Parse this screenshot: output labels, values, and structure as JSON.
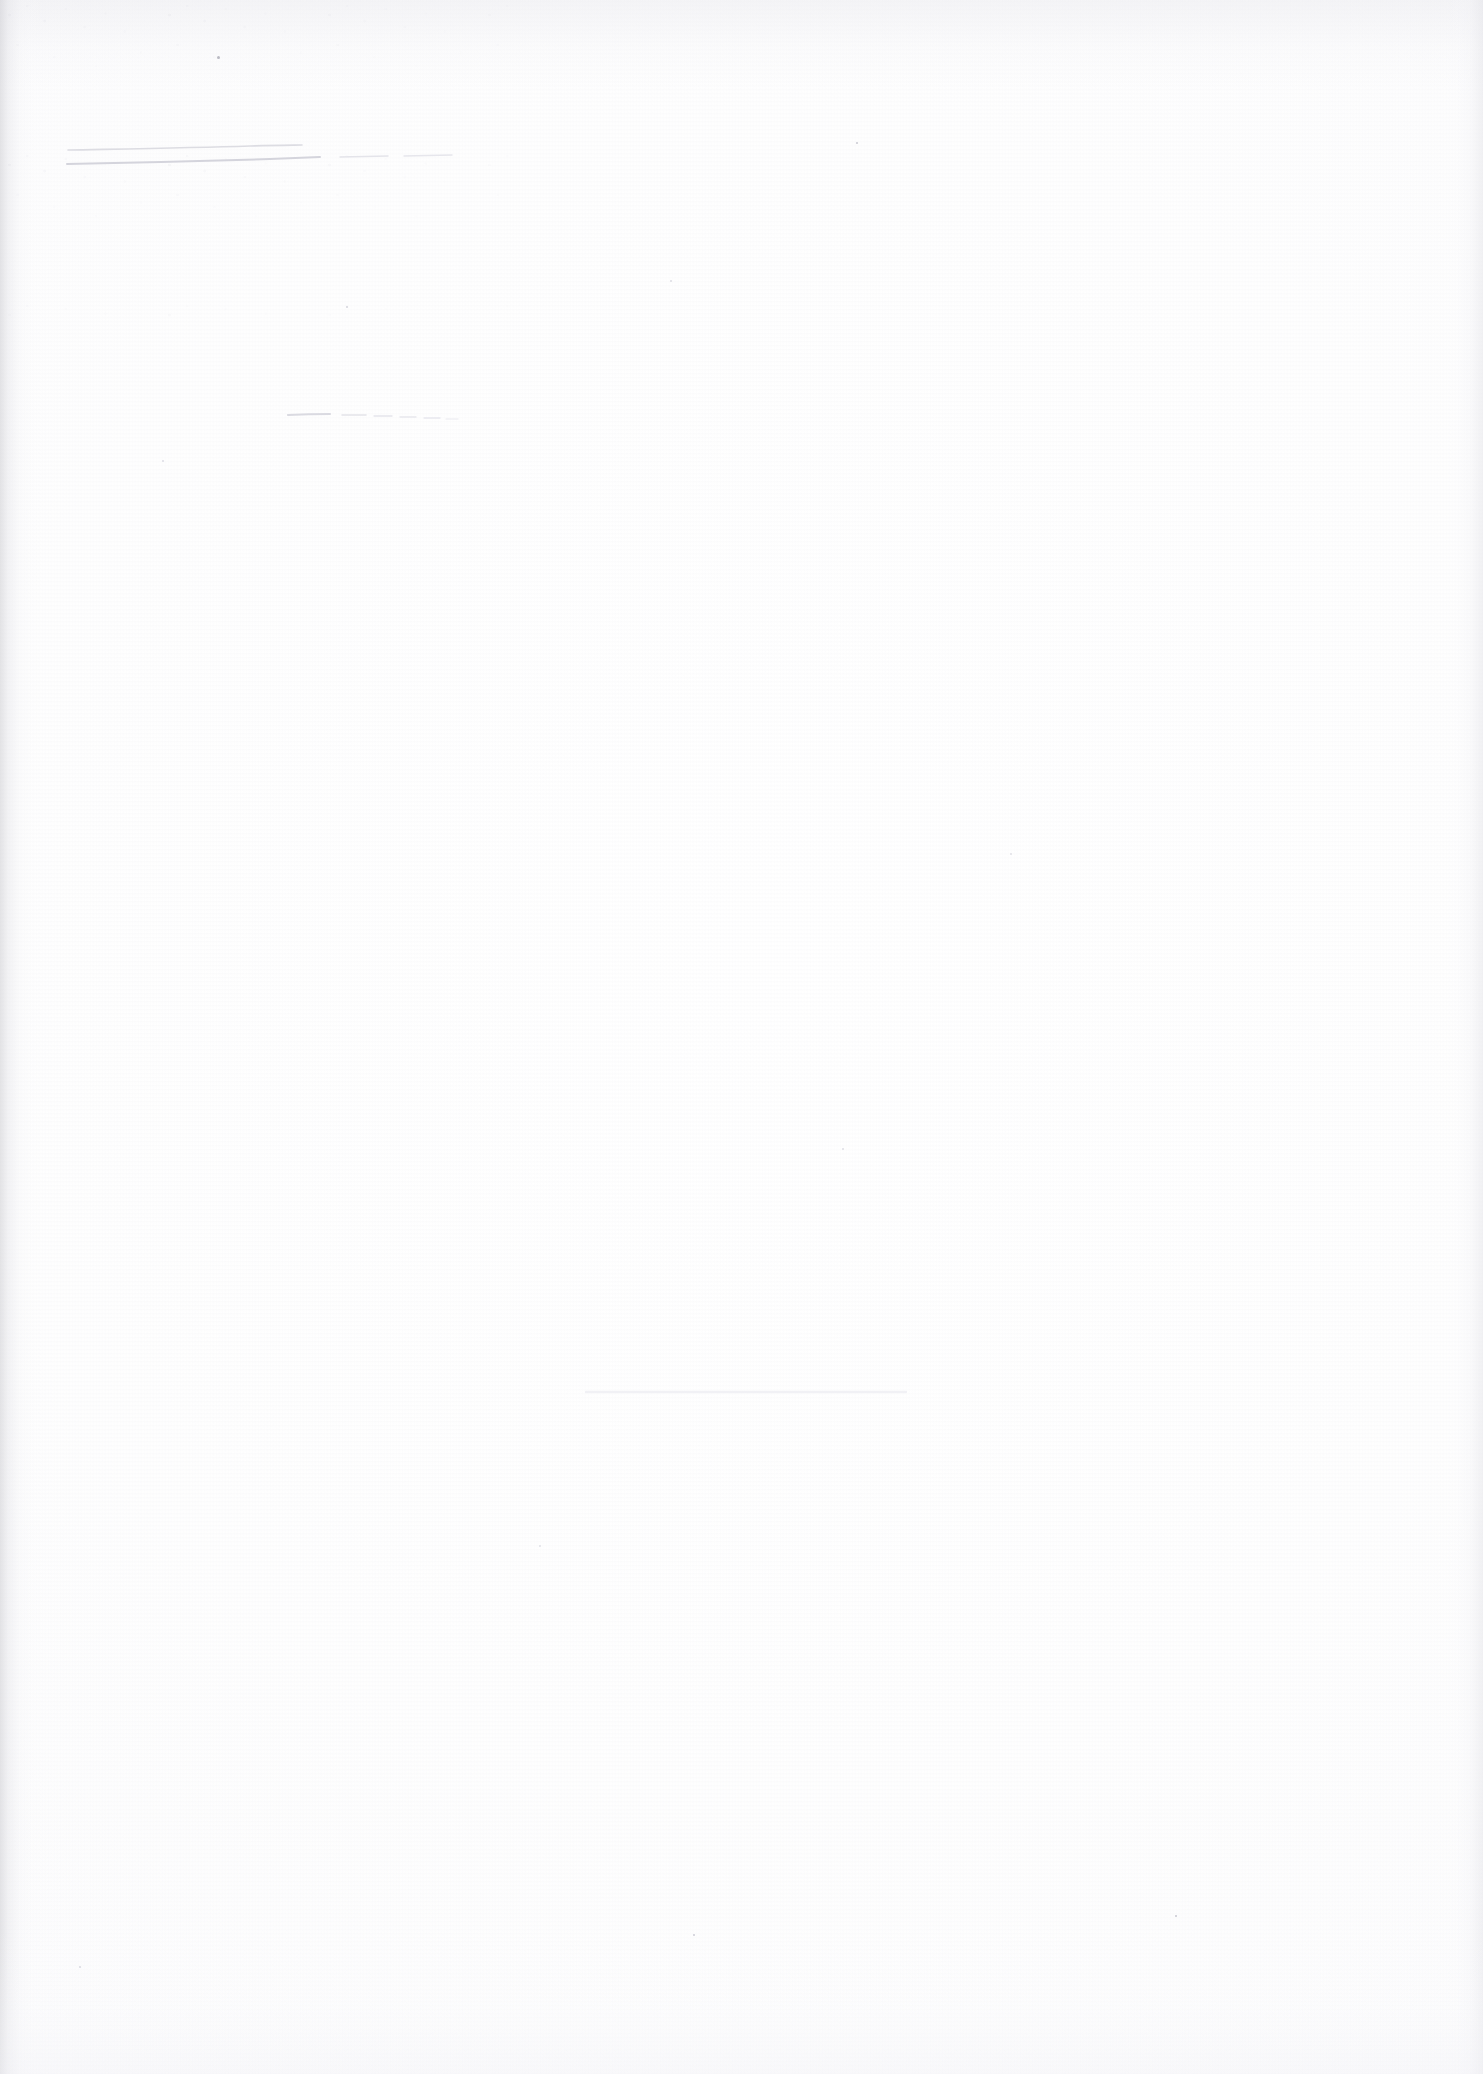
{
  "document": {
    "kind": "scanned-page",
    "title": "Scanned blank page",
    "page_width": 1483,
    "page_height": 2074,
    "orientation": "portrait",
    "visible_text": "",
    "text_note": "No legible printed or handwritten text is rendered on this page.",
    "background_color": "#ffffff",
    "paper_tone": "#fdfdfe",
    "grain_color": "#ececf1"
  },
  "scan_artifacts": {
    "left_edge_shadow_color": "#cdcdd2",
    "right_edge_shadow_color": "#e2e2e7",
    "top_edge_shadow_color": "#e7e7ec",
    "bottom_edge_shadow_color": "#f2f2f6",
    "grain_opacity": "0.55",
    "corner_noise_region": "top-left"
  },
  "marks": [
    {
      "id": "stroke-upper",
      "label": "faint-pencil-stroke-upper",
      "color": "#dcdce2",
      "stroke_width": 1.6,
      "x_start": 68,
      "x_end": 302,
      "y_start": 150,
      "y_end": 146,
      "path": "M68,150 C120,149 190,148 250,146 C272,145.4 290,145.2 302,145"
    },
    {
      "id": "stroke-lower",
      "label": "faint-pencil-stroke-lower",
      "color": "#d4d4dc",
      "stroke_width": 2.0,
      "x_start": 67,
      "x_end": 320,
      "y_start": 164,
      "y_end": 157,
      "path": "M67,164 C130,163 210,161 270,159 C296,158 310,157.4 320,157"
    },
    {
      "id": "stroke-dash-a",
      "label": "faint-dash-segment-a",
      "color": "#e4e4ea",
      "stroke_width": 1.4,
      "x_start": 340,
      "x_end": 388,
      "y_start": 157,
      "y_end": 156,
      "path": "M340,157 L388,156"
    },
    {
      "id": "stroke-dash-b",
      "label": "faint-dash-segment-b",
      "color": "#e6e6ec",
      "stroke_width": 1.4,
      "x_start": 404,
      "x_end": 452,
      "y_start": 156,
      "y_end": 155,
      "path": "M404,156 L452,155"
    },
    {
      "id": "stroke-mid-solid",
      "label": "faint-pencil-stroke-middle",
      "color": "#dadae1",
      "stroke_width": 2.2,
      "x_start": 288,
      "x_end": 330,
      "y_start": 415,
      "y_end": 414,
      "path": "M288,415 C300,414.4 318,414 330,414"
    },
    {
      "id": "stroke-mid-dash-a",
      "label": "faint-dash-middle-a",
      "color": "#e3e3e9",
      "stroke_width": 1.5,
      "x_start": 342,
      "x_end": 366,
      "y_start": 415,
      "y_end": 415,
      "path": "M342,415 L366,415"
    },
    {
      "id": "stroke-mid-dash-b",
      "label": "faint-dash-middle-b",
      "color": "#e5e5eb",
      "stroke_width": 1.4,
      "x_start": 374,
      "x_end": 392,
      "y_start": 416,
      "y_end": 416,
      "path": "M374,416 L392,416"
    },
    {
      "id": "stroke-mid-dash-c",
      "label": "faint-dash-middle-c",
      "color": "#e7e7ed",
      "stroke_width": 1.3,
      "x_start": 400,
      "x_end": 416,
      "y_start": 417,
      "y_end": 417,
      "path": "M400,417 L416,417"
    },
    {
      "id": "stroke-mid-dash-d",
      "label": "faint-dash-middle-d",
      "color": "#e8e8ee",
      "stroke_width": 1.3,
      "x_start": 424,
      "x_end": 440,
      "y_start": 418,
      "y_end": 418,
      "path": "M424,418 L440,418"
    },
    {
      "id": "stroke-mid-dash-e",
      "label": "faint-dash-middle-e",
      "color": "#eaeaef",
      "stroke_width": 1.2,
      "x_start": 446,
      "x_end": 458,
      "y_start": 419,
      "y_end": 419,
      "path": "M446,419 L458,419"
    },
    {
      "id": "smudge-bottom",
      "label": "faint-horizontal-smudge-bottom",
      "color": "#f1f1f5",
      "stroke_width": 2.4,
      "x_start": 586,
      "x_end": 906,
      "y_start": 1392,
      "y_end": 1392,
      "path": "M586,1392 L906,1392"
    }
  ],
  "specks": [
    {
      "label": "speck-top-left",
      "x": 218,
      "y": 57,
      "size": 3.0,
      "color": "#b9b9c2"
    },
    {
      "label": "speck-upper-right",
      "x": 857,
      "y": 143,
      "size": 2.2,
      "color": "#c9c9d1"
    },
    {
      "label": "speck-mid-left",
      "x": 347,
      "y": 307,
      "size": 2.4,
      "color": "#d5d5dc"
    },
    {
      "label": "speck-mid-center",
      "x": 671,
      "y": 281,
      "size": 2.0,
      "color": "#dcdce3"
    },
    {
      "label": "speck-left-lower",
      "x": 163,
      "y": 461,
      "size": 2.0,
      "color": "#dddde4"
    },
    {
      "label": "speck-right-lower",
      "x": 1011,
      "y": 854,
      "size": 2.0,
      "color": "#e0e0e6"
    },
    {
      "label": "speck-center-low",
      "x": 843,
      "y": 1149,
      "size": 2.0,
      "color": "#dedee5"
    },
    {
      "label": "speck-bottom-left",
      "x": 80,
      "y": 1967,
      "size": 2.2,
      "color": "#d9d9e1"
    },
    {
      "label": "speck-bottom-right",
      "x": 1176,
      "y": 1916,
      "size": 2.4,
      "color": "#c7c7d0"
    },
    {
      "label": "speck-bottom-mid",
      "x": 694,
      "y": 1935,
      "size": 2.6,
      "color": "#cdcdd6"
    },
    {
      "label": "speck-low-center",
      "x": 540,
      "y": 1546,
      "size": 1.8,
      "color": "#e1e1e7"
    }
  ]
}
